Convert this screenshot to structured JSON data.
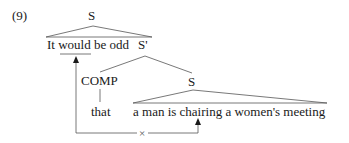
{
  "example_number": "(9)",
  "tree": {
    "root_label": "S",
    "matrix_clause": "It would be odd",
    "sbar_label": "S'",
    "comp_label": "COMP",
    "complementizer": "that",
    "embedded_s_label": "S",
    "embedded_clause": "a man is chairing a women's meeting"
  },
  "annotations": {
    "blocked_movement_marker": "×",
    "underlined_word": "would"
  },
  "colors": {
    "text": "#1a1a1a",
    "lines": "#555555"
  }
}
